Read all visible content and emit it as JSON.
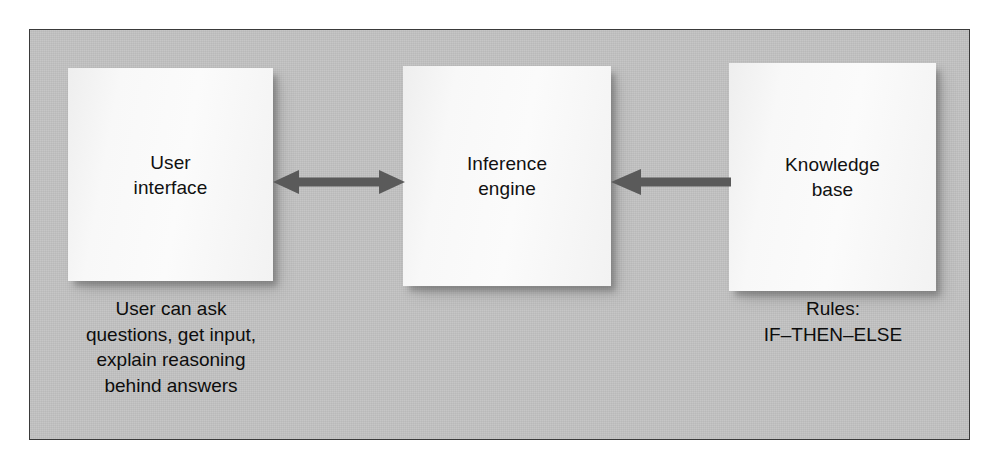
{
  "diagram": {
    "panel": {
      "background_color": "#c3c3c3",
      "border_color": "#3a3a3a"
    },
    "nodes": [
      {
        "id": "user-interface",
        "label": "User\ninterface",
        "fill_color": "#f6f6f6"
      },
      {
        "id": "inference-engine",
        "label": "Inference\nengine",
        "fill_color": "#f8f8f8"
      },
      {
        "id": "knowledge-base",
        "label": "Knowledge\nbase",
        "fill_color": "#f8f8f8"
      }
    ],
    "connectors": [
      {
        "id": "ui-inference",
        "from": "user-interface",
        "to": "inference-engine",
        "direction": "bidirectional",
        "color": "#5a5a5a"
      },
      {
        "id": "kb-inference",
        "from": "knowledge-base",
        "to": "inference-engine",
        "direction": "left",
        "color": "#5a5a5a"
      }
    ],
    "captions": [
      {
        "id": "user-interface",
        "text": "User can ask\nquestions, get input,\nexplain reasoning\nbehind answers"
      },
      {
        "id": "knowledge-base",
        "text": "Rules:\nIF–THEN–ELSE"
      }
    ]
  }
}
